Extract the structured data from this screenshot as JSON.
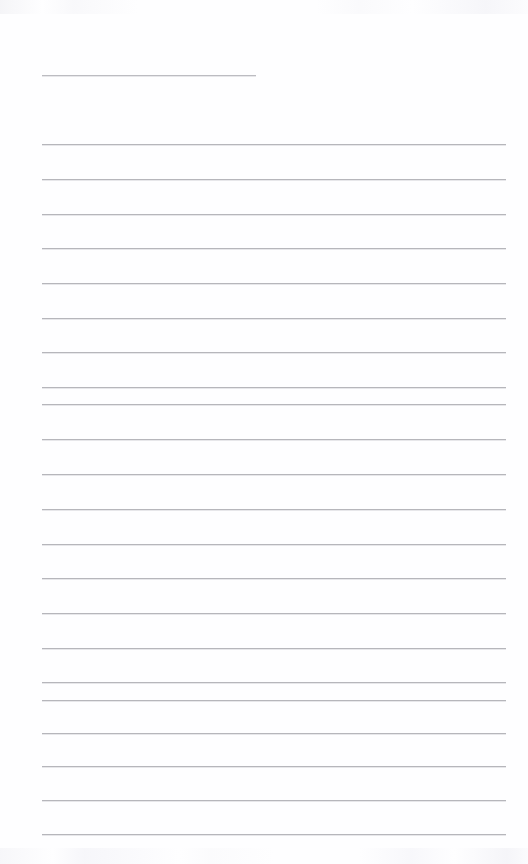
{
  "document": {
    "kind": "lined-notebook-page",
    "title_line_label": "Title / heading rule",
    "body_label": "Ruled writing lines",
    "page_background_color": "#fefeff",
    "rule_color": "#b6b6bb",
    "page_width": 528,
    "page_height": 864,
    "content_text": "",
    "placeholder": ""
  },
  "layout": {
    "left_margin": 42,
    "right_edge": 506,
    "title_rule_right_edge": 256,
    "line_spacing": 34.5,
    "first_body_line_y": 144
  },
  "title_rule": {
    "name": "title-rule",
    "x": 42,
    "y": 75,
    "width": 214
  },
  "body_rules": [
    {
      "y": 144,
      "x": 42,
      "width": 464
    },
    {
      "y": 179,
      "x": 42,
      "width": 464
    },
    {
      "y": 214,
      "x": 42,
      "width": 464
    },
    {
      "y": 248,
      "x": 42,
      "width": 464
    },
    {
      "y": 283,
      "x": 42,
      "width": 464
    },
    {
      "y": 318,
      "x": 42,
      "width": 464
    },
    {
      "y": 352,
      "x": 42,
      "width": 464
    },
    {
      "y": 387,
      "x": 42,
      "width": 464
    },
    {
      "y": 404,
      "x": 42,
      "width": 464
    },
    {
      "y": 439,
      "x": 42,
      "width": 464
    },
    {
      "y": 474,
      "x": 42,
      "width": 464
    },
    {
      "y": 509,
      "x": 42,
      "width": 464
    },
    {
      "y": 544,
      "x": 42,
      "width": 464
    },
    {
      "y": 578,
      "x": 42,
      "width": 464
    },
    {
      "y": 613,
      "x": 42,
      "width": 464
    },
    {
      "y": 648,
      "x": 42,
      "width": 464
    },
    {
      "y": 682,
      "x": 42,
      "width": 464
    },
    {
      "y": 700,
      "x": 42,
      "width": 464
    },
    {
      "y": 733,
      "x": 42,
      "width": 464
    },
    {
      "y": 766,
      "x": 42,
      "width": 464
    },
    {
      "y": 800,
      "x": 42,
      "width": 464
    },
    {
      "y": 834,
      "x": 42,
      "width": 464
    }
  ]
}
